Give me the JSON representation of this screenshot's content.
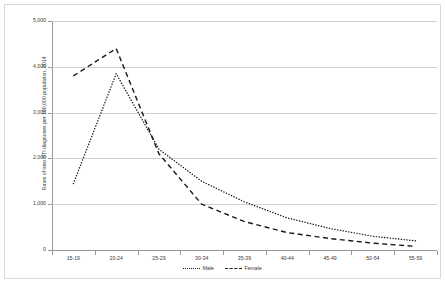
{
  "chart_data": {
    "type": "line",
    "title": "",
    "xlabel": "",
    "ylabel": "Rates of new STI diagnoses per 100,000 population, 2014",
    "categories": [
      "15-19",
      "20-24",
      "25-29",
      "30-34",
      "35-39",
      "40-44",
      "45-49",
      "50-54",
      "55-59"
    ],
    "ylim": [
      0,
      5000
    ],
    "ytick_labels": [
      "5,000",
      "4,000",
      "3,000",
      "2,000",
      "1,000",
      "0"
    ],
    "ytick_values": [
      5000,
      4000,
      3000,
      2000,
      1000,
      0
    ],
    "grid": true,
    "legend_position": "bottom",
    "series": [
      {
        "name": "Male",
        "linestyle": "dotted",
        "color": "#1a1a1a",
        "values": [
          1450,
          3850,
          2200,
          1500,
          1050,
          700,
          470,
          300,
          200
        ]
      },
      {
        "name": "Female",
        "linestyle": "dashed",
        "color": "#1a1a1a",
        "values": [
          3800,
          4400,
          2100,
          1000,
          620,
          380,
          250,
          150,
          80
        ]
      }
    ]
  },
  "legend": {
    "items": [
      {
        "label": "Male",
        "style": "dotted"
      },
      {
        "label": "Female",
        "style": "dashed"
      }
    ]
  },
  "colors": {
    "gridline": "#d0d0d0",
    "axis": "#9a9a9a",
    "text": "#3a3a3a",
    "series": "#1a1a1a",
    "border": "#d9d9d9",
    "background": "#ffffff"
  }
}
